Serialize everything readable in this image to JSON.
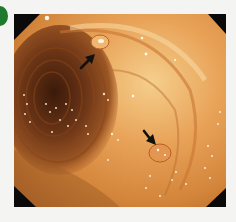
{
  "figure": {
    "type": "endoscopic-photograph",
    "panel_label_color": "#1f7a2e",
    "colors": {
      "background": "#f4f4f2",
      "mucosa_light": "#f2c27a",
      "mucosa_mid": "#d98a3c",
      "mucosa_dark": "#a65a22",
      "lumen_dark": "#4a2410",
      "corner_mask": "#0a0a0a",
      "arrow": "#111111"
    },
    "annotations": [
      {
        "id": "arrow-1",
        "label": "",
        "direction": "up-right",
        "tail": [
          81,
          68
        ],
        "head": [
          93,
          56
        ],
        "target": "small sessile polyp",
        "target_center": [
          99,
          42
        ]
      },
      {
        "id": "arrow-2",
        "label": "",
        "direction": "down-right",
        "tail": [
          144,
          131
        ],
        "head": [
          154,
          143
        ],
        "target": "flat lesion",
        "target_center": [
          160,
          153
        ]
      }
    ]
  }
}
